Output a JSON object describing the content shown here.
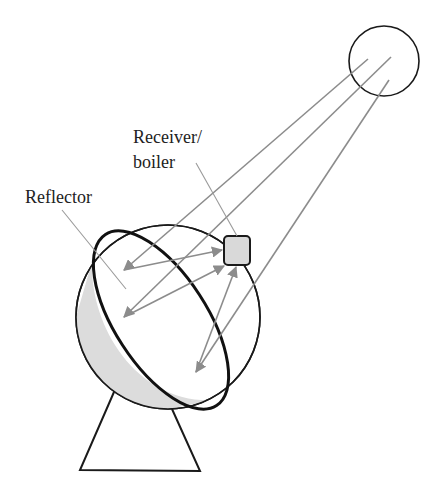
{
  "diagram": {
    "labels": {
      "receiver_line1": "Receiver/",
      "receiver_line2": "boiler",
      "reflector": "Reflector"
    },
    "components": [
      {
        "id": "sun",
        "shape": "circle"
      },
      {
        "id": "reflector",
        "shape": "dish"
      },
      {
        "id": "receiver",
        "shape": "rounded-square"
      },
      {
        "id": "stand",
        "shape": "triangle"
      }
    ],
    "colors": {
      "stroke": "#1a1a1a",
      "ray": "#8c8c8c",
      "receiver_fill": "#d9d9d9",
      "dish_shade": "#dcdcdc",
      "leader": "#9a9a9a"
    }
  }
}
